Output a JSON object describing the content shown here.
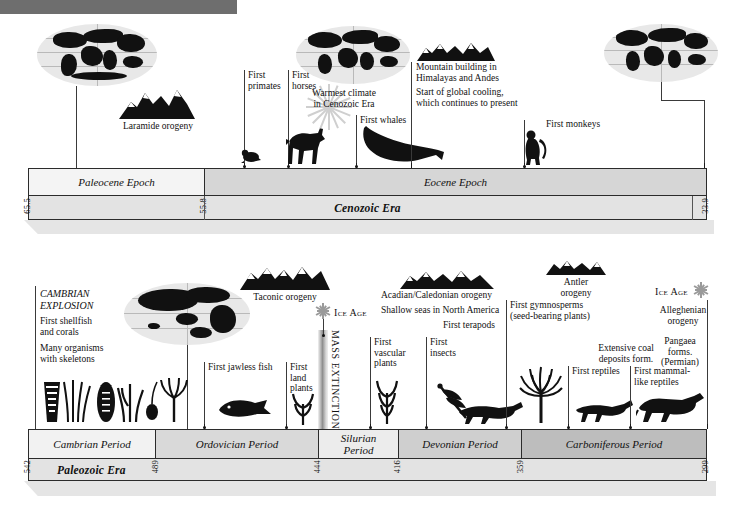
{
  "page": {
    "header_bar_color": "#6e6e6e"
  },
  "colors": {
    "ink": "#111111",
    "bar_border": "#2b2b2b",
    "era_fill": "#e3e3e3",
    "epoch_light": "#f2f2f2",
    "epoch_mid": "#d3d3d3",
    "epoch_dark": "#b9b9b9",
    "icon_gray": "#9a9a9a"
  },
  "top_timeline": {
    "name": "Cenozoic timeline",
    "era_label": "Cenozoic Era",
    "epochs": [
      {
        "label": "Paleocene Epoch",
        "fill": "#f4f4f4"
      },
      {
        "label": "Eocene Epoch",
        "fill": "#d6d6d6"
      }
    ],
    "age_marks": [
      "65.5",
      "55.8",
      "33.9"
    ],
    "events": [
      {
        "label": "Laramide orogeny"
      },
      {
        "label": "First\nprimates"
      },
      {
        "label": "First\nhorses"
      },
      {
        "label": "Warmest climate\nin Cenozoic Era"
      },
      {
        "label": "First whales"
      },
      {
        "label": "Mountain building in\nHimalayas and Andes"
      },
      {
        "label": "Start of global cooling,\nwhich continues to present"
      },
      {
        "label": "First monkeys"
      }
    ]
  },
  "bottom_timeline": {
    "name": "Paleozoic timeline",
    "era_label": "Paleozoic Era",
    "periods": [
      {
        "label": "Cambrian Period",
        "fill": "#f2f2f2"
      },
      {
        "label": "Ordovician Period",
        "fill": "#d9d9d9"
      },
      {
        "label": "Silurian\nPeriod",
        "fill": "#ececec"
      },
      {
        "label": "Devonian Period",
        "fill": "#cfcfcf"
      },
      {
        "label": "Carboniferous Period",
        "fill": "#bdbdbd"
      }
    ],
    "age_marks": [
      "542",
      "489",
      "444",
      "416",
      "359",
      "299"
    ],
    "events": [
      {
        "label": "CAMBRIAN\nEXPLOSION"
      },
      {
        "label": "First shellfish\nand corals"
      },
      {
        "label": "Many organisms\nwith skeletons"
      },
      {
        "label": "Taconic orogeny"
      },
      {
        "label": "First jawless fish"
      },
      {
        "label": "First\nland\nplants"
      },
      {
        "label": "MASS EXTINCTION"
      },
      {
        "label": "Ice Age"
      },
      {
        "label": "Acadian/Caledonian orogeny"
      },
      {
        "label": "Shallow seas in North America"
      },
      {
        "label": "First terapods"
      },
      {
        "label": "First\nvascular\nplants"
      },
      {
        "label": "First\ninsects"
      },
      {
        "label": "First gymnosperms\n(seed-bearing plants)"
      },
      {
        "label": "Antler\norogeny"
      },
      {
        "label": "Extensive coal\ndeposits form."
      },
      {
        "label": "First reptiles"
      },
      {
        "label": "First mammal-\nlike reptiles"
      },
      {
        "label": "Ice Age"
      },
      {
        "label": "Alleghenian\norogeny"
      },
      {
        "label": "Pangaea\nforms.\n(Permian)"
      }
    ]
  },
  "icons": {
    "snowflake": "snowflake-icon",
    "sunburst": "sunburst-icon",
    "globe": "globe-icon",
    "mountain": "mountain-icon"
  }
}
